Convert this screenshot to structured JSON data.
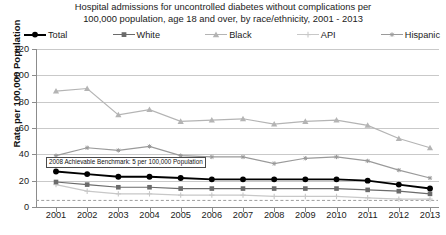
{
  "title": {
    "line1": "Hospital admissions for uncontrolled diabetes without complications per",
    "line2": "100,000 population, age 18 and over, by race/ethnicity, 2001 - 2013"
  },
  "axes": {
    "ylabel": "Rate per 100,000 Population",
    "xlabel": ""
  },
  "legend": [
    {
      "label": "Total",
      "color": "#000000",
      "marker": "circle"
    },
    {
      "label": "White",
      "color": "#6b6b6b",
      "marker": "square"
    },
    {
      "label": "Black",
      "color": "#b4b4b4",
      "marker": "triangle"
    },
    {
      "label": "API",
      "color": "#c8c8c8",
      "marker": "plus"
    },
    {
      "label": "Hispanic",
      "color": "#9a9a9a",
      "marker": "asterisk"
    }
  ],
  "annotation": {
    "benchmark_text": "2008 Achievable Benchmark: 5 per 100,000 Population",
    "benchmark_value": 5
  },
  "chart_data": {
    "type": "line",
    "title": "Hospital admissions for uncontrolled diabetes without complications per 100,000 population, age 18 and over, by race/ethnicity, 2001 - 2013",
    "xlabel": "",
    "ylabel": "Rate per 100,000 Population",
    "ylim": [
      0,
      120
    ],
    "yticks": [
      0,
      20,
      40,
      60,
      80,
      100,
      120
    ],
    "grid": true,
    "legend_position": "top",
    "categories": [
      "2001",
      "2002",
      "2003",
      "2004",
      "2005",
      "2006",
      "2007",
      "2008",
      "2009",
      "2010",
      "2011",
      "2012",
      "2013"
    ],
    "series": [
      {
        "name": "Total",
        "color": "#000000",
        "marker": "circle",
        "values": [
          27,
          25,
          23,
          23,
          22,
          21,
          21,
          21,
          21,
          21,
          20,
          17,
          14
        ]
      },
      {
        "name": "White",
        "color": "#6b6b6b",
        "marker": "square",
        "values": [
          19,
          17,
          15,
          15,
          14,
          14,
          14,
          14,
          14,
          14,
          13,
          12,
          10
        ]
      },
      {
        "name": "Black",
        "color": "#b4b4b4",
        "marker": "triangle",
        "values": [
          88,
          90,
          70,
          74,
          65,
          66,
          67,
          63,
          65,
          66,
          62,
          52,
          45
        ]
      },
      {
        "name": "API",
        "color": "#c8c8c8",
        "marker": "plus",
        "values": [
          17,
          12,
          10,
          10,
          9,
          9,
          9,
          8,
          8,
          8,
          7,
          6,
          6
        ]
      },
      {
        "name": "Hispanic",
        "color": "#9a9a9a",
        "marker": "asterisk",
        "values": [
          39,
          45,
          43,
          46,
          39,
          38,
          38,
          33,
          37,
          38,
          35,
          28,
          22
        ]
      }
    ],
    "benchmark_line": {
      "label": "2008 Achievable Benchmark: 5 per 100,000 Population",
      "value": 5,
      "style": "dashed"
    }
  }
}
